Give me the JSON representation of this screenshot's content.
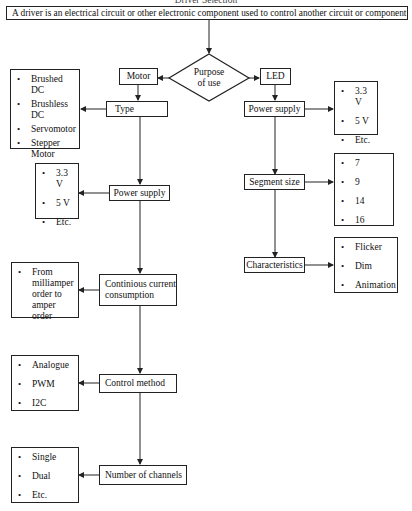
{
  "title": "Driver Selection",
  "definition": "A driver is an electrical circuit or other electronic component used to control another circuit or component",
  "decision": {
    "label_line1": "Purpose",
    "label_line2": "of use"
  },
  "motor_branch": {
    "label": "Motor",
    "steps": [
      {
        "label": "Type",
        "options": [
          "Brushed DC",
          "Brushless DC",
          "Servomotor",
          "Stepper Motor"
        ]
      },
      {
        "label": "Power  supply",
        "options": [
          "3.3 V",
          "5 V",
          "Etc."
        ]
      },
      {
        "label": "Continious current consumption",
        "options": [
          "From milliamper order to amper order"
        ]
      },
      {
        "label": "Control method",
        "options": [
          "Analogue",
          "PWM",
          "I2C"
        ]
      },
      {
        "label": "Number of channels",
        "options": [
          "Single",
          "Dual",
          "Etc."
        ]
      }
    ]
  },
  "led_branch": {
    "label": "LED",
    "steps": [
      {
        "label": "Power  supply",
        "options": [
          "3.3 V",
          "5 V",
          "Etc."
        ]
      },
      {
        "label": "Segment size",
        "options": [
          "7",
          "9",
          "14",
          "16"
        ]
      },
      {
        "label": "Characteristics",
        "options": [
          "Flicker",
          "Dim",
          "Animation"
        ]
      }
    ]
  },
  "colors": {
    "line": "#222222",
    "background": "#ffffff"
  }
}
